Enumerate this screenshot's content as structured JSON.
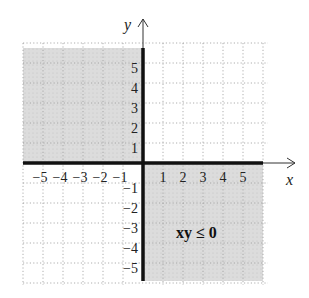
{
  "chart_data": {
    "type": "region",
    "title": "",
    "inequality": "xy ≤ 0",
    "xlabel": "x",
    "ylabel": "y",
    "xlim": [
      -6,
      6
    ],
    "ylim": [
      -6,
      6
    ],
    "x_ticks": [
      -5,
      -4,
      -3,
      -2,
      -1,
      1,
      2,
      3,
      4,
      5
    ],
    "y_ticks": [
      -5,
      -4,
      -3,
      -2,
      -1,
      1,
      2,
      3,
      4,
      5
    ],
    "x_tick_labels": [
      "−5",
      "−4",
      "−3",
      "−2",
      "−1",
      "1",
      "2",
      "3",
      "4",
      "5"
    ],
    "y_tick_labels": [
      "−5",
      "−4",
      "−3",
      "−2",
      "−1",
      "1",
      "2",
      "3",
      "4",
      "5"
    ],
    "grid": true,
    "shaded_regions": [
      "quadrant II (x ≤ 0, y ≥ 0)",
      "quadrant IV (x ≥ 0, y ≤ 0)"
    ],
    "boundary": "x-axis and y-axis (solid, included)",
    "shade_color": "#d9d9d9",
    "axis_color": "#111111"
  },
  "labels": {
    "x_axis": "x",
    "y_axis": "y",
    "region": "xy ≤ 0"
  }
}
